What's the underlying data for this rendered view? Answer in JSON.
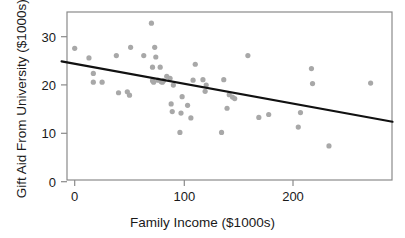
{
  "chart_data": {
    "type": "scatter",
    "title": "",
    "subtitle": "",
    "xlabel": "Family Income ($1000s)",
    "ylabel": "Gift Aid From University ($1000s)",
    "xlim": [
      -12,
      290
    ],
    "ylim": [
      -3.5,
      35
    ],
    "xticks": [
      0,
      100,
      200
    ],
    "xtick_labels": [
      "0",
      "100",
      "200"
    ],
    "yticks": [
      0,
      10,
      20,
      30
    ],
    "ytick_labels": [
      "0",
      "10",
      "20",
      "30"
    ],
    "grid": false,
    "legend": null,
    "point_color": "#a8a8a8",
    "point_size_px": 5.2,
    "line_color": "#111111",
    "axis_color": "#8a8a8a",
    "n_points": 50,
    "x": [
      0,
      13,
      17,
      17,
      25,
      38,
      40,
      48,
      50,
      51,
      63,
      70,
      71,
      71,
      72,
      73,
      74,
      76,
      78,
      79,
      80,
      81,
      84,
      87,
      88,
      89,
      90,
      96,
      97,
      98,
      103,
      106,
      108,
      110,
      117,
      119,
      120,
      134,
      136,
      139,
      141,
      144,
      146,
      158,
      168,
      177,
      204,
      206,
      216,
      217,
      232,
      270
    ],
    "y": [
      27.6,
      25.6,
      22.4,
      20.6,
      20.6,
      26.1,
      18.4,
      18.6,
      17.9,
      27.8,
      26.1,
      32.8,
      23.7,
      20.9,
      20.6,
      27.8,
      25.8,
      21.0,
      23.7,
      20.7,
      20.6,
      20.9,
      21.8,
      21.4,
      16.1,
      14.5,
      20.0,
      10.2,
      14.2,
      17.6,
      15.8,
      13.2,
      21.0,
      24.3,
      21.1,
      18.7,
      20.0,
      10.2,
      21.1,
      15.2,
      18.0,
      17.5,
      17.2,
      26.1,
      13.3,
      13.9,
      11.3,
      14.3,
      23.4,
      20.3,
      7.4,
      20.4
    ],
    "trend_line": {
      "type": "linear-fit",
      "x_start": -12,
      "y_start": 24.9,
      "x_end": 290,
      "y_end": 12.4,
      "slope": -0.0414,
      "intercept": 24.4
    }
  },
  "axes": {
    "x_title": "Family Income ($1000s)",
    "y_title": "Gift Aid From University ($1000s)",
    "x_tick_labels": [
      "0",
      "100",
      "200"
    ],
    "y_tick_labels": [
      "0",
      "10",
      "20",
      "30"
    ]
  }
}
